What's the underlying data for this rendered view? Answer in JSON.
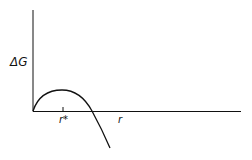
{
  "diagram": {
    "y_axis_label": "ΔG",
    "x_axis_label": "r",
    "critical_label": "r*",
    "curve": "nucleation free energy vs radius: rises to maximum at r*, then falls below zero"
  },
  "colors": {
    "ink": "#111111",
    "background": "#ffffff"
  }
}
